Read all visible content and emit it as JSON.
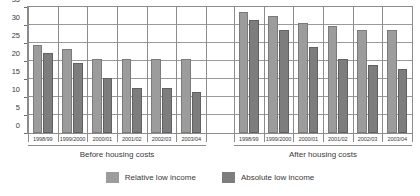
{
  "chart_data": {
    "type": "bar",
    "title": "",
    "subtitle": "",
    "xlabel": "",
    "ylabel": "",
    "ylim": [
      0,
      35
    ],
    "yticks": [
      0,
      5,
      10,
      15,
      20,
      25,
      30,
      35
    ],
    "grid": true,
    "legend_position": "bottom",
    "categories": [
      "1998/99",
      "1999/2000",
      "2000/01",
      "2001/02",
      "2002/03",
      "2003/04"
    ],
    "panels": [
      {
        "name": "before-housing-costs",
        "caption": "Before housing costs",
        "series": [
          {
            "name": "Relative low income",
            "values": [
              24.4,
              23.4,
              20.5,
              20.5,
              20.5,
              20.5
            ]
          },
          {
            "name": "Absolute low income",
            "values": [
              22.2,
              19.4,
              15.2,
              12.5,
              12.6,
              11.3
            ]
          }
        ]
      },
      {
        "name": "after-housing-costs",
        "caption": "After housing costs",
        "series": [
          {
            "name": "Relative low income",
            "values": [
              33.5,
              32.6,
              30.6,
              29.6,
              28.7,
              28.7
            ]
          },
          {
            "name": "Absolute low income",
            "values": [
              31.5,
              28.5,
              23.8,
              20.6,
              18.8,
              17.9
            ]
          }
        ]
      }
    ],
    "legend": [
      {
        "label": "Relative low income",
        "color": "#9c9c9c"
      },
      {
        "label": "Absolute low income",
        "color": "#7d7d7d"
      }
    ],
    "colors": {
      "relative_low_income": "#9c9c9c",
      "absolute_low_income": "#7d7d7d",
      "gridline": "#9a9a9a",
      "axis": "#8c8c8c",
      "text": "#3a3a3a",
      "background": "#ffffff"
    }
  }
}
